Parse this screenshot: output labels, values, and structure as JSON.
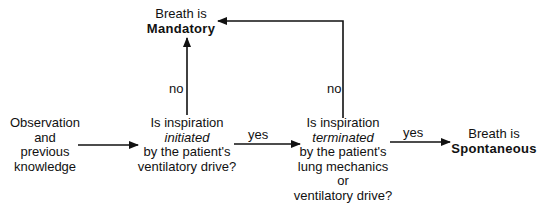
{
  "diagram": {
    "type": "flowchart",
    "nodes": {
      "start": {
        "lines": [
          "Observation",
          "and",
          "previous",
          "knowledge"
        ]
      },
      "q1": {
        "line1": "Is inspiration",
        "line2_italic": "initiated",
        "line3": "by the patient's",
        "line4": "ventilatory drive?"
      },
      "q2": {
        "line1": "Is inspiration",
        "line2_italic": "terminated",
        "line3": "by the patient's",
        "line4": "lung mechanics",
        "line5": "or",
        "line6": "ventilatory drive?"
      },
      "mandatory": {
        "line1": "Breath is",
        "line2_bold": "Mandatory"
      },
      "spontaneous": {
        "line1": "Breath is",
        "line2_bold": "Spontaneous"
      }
    },
    "edges": {
      "start_to_q1": {
        "label": ""
      },
      "q1_yes": {
        "label": "yes"
      },
      "q1_no": {
        "label": "no"
      },
      "q2_yes": {
        "label": "yes"
      },
      "q2_no": {
        "label": "no"
      }
    },
    "colors": {
      "line": "#111111",
      "background": "#ffffff"
    }
  }
}
